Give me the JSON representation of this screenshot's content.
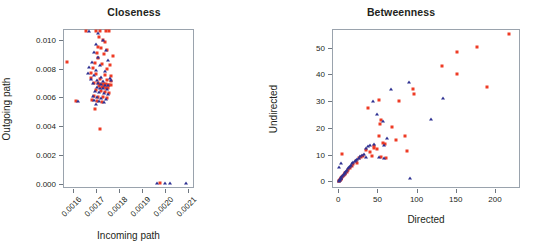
{
  "figure": {
    "background": "#ffffff",
    "series_colors": {
      "directed_red": "#ee3b24",
      "undirected_blue": "#2e3192"
    }
  },
  "panels": [
    {
      "id": "closeness",
      "title": "Closeness",
      "xlabel": "Incoming path",
      "ylabel": "Outgoing path",
      "xticks": [
        "0.0016",
        "0.0017",
        "0.0018",
        "0.0019",
        "0.0020",
        "0.0021"
      ],
      "yticks": [
        "0.000",
        "0.002",
        "0.004",
        "0.006",
        "0.008",
        "0.010"
      ]
    },
    {
      "id": "betweenness",
      "title": "Betweenness",
      "xlabel": "Directed",
      "ylabel": "Undirected",
      "xticks": [
        "0",
        "50",
        "100",
        "150",
        "200"
      ],
      "yticks": [
        "0",
        "10",
        "20",
        "30",
        "40",
        "50"
      ]
    }
  ],
  "chart_data": [
    {
      "type": "scatter",
      "title": "Closeness",
      "xlabel": "Incoming path",
      "ylabel": "Outgoing path",
      "xlim": [
        0.001555,
        0.002125
      ],
      "ylim": [
        -0.0003,
        0.01075
      ],
      "xticks": [
        0.0016,
        0.0017,
        0.0018,
        0.0019,
        0.002,
        0.0021
      ],
      "yticks": [
        0.0,
        0.002,
        0.004,
        0.006,
        0.008,
        0.01
      ],
      "grid": false,
      "legend": "none",
      "series": [
        {
          "name": "red-square",
          "marker": "square",
          "color": "#ee3b24",
          "points": [
            [
              0.001572,
              0.00849
            ],
            [
              0.00161,
              0.00578
            ],
            [
              0.001655,
              0.0106
            ],
            [
              0.0017,
              0.0106
            ],
            [
              0.001718,
              0.0106
            ],
            [
              0.001742,
              0.0106
            ],
            [
              0.001757,
              0.01059
            ],
            [
              0.001713,
              0.01018
            ],
            [
              0.00173,
              0.01
            ],
            [
              0.001739,
              0.00985
            ],
            [
              0.001707,
              0.00952
            ],
            [
              0.001722,
              0.00942
            ],
            [
              0.001748,
              0.0093
            ],
            [
              0.001702,
              0.00908
            ],
            [
              0.001735,
              0.009
            ],
            [
              0.001771,
              0.00888
            ],
            [
              0.001706,
              0.00872
            ],
            [
              0.001693,
              0.00838
            ],
            [
              0.001724,
              0.0083
            ],
            [
              0.001758,
              0.00822
            ],
            [
              0.001684,
              0.00805
            ],
            [
              0.001747,
              0.00798
            ],
            [
              0.001676,
              0.00772
            ],
            [
              0.0017,
              0.00765
            ],
            [
              0.001736,
              0.00757
            ],
            [
              0.001763,
              0.00748
            ],
            [
              0.001679,
              0.00733
            ],
            [
              0.001714,
              0.00726
            ],
            [
              0.001745,
              0.00718
            ],
            [
              0.001766,
              0.00712
            ],
            [
              0.00169,
              0.00702
            ],
            [
              0.001706,
              0.00698
            ],
            [
              0.001718,
              0.00696
            ],
            [
              0.001727,
              0.00694
            ],
            [
              0.001734,
              0.00692
            ],
            [
              0.001741,
              0.0069
            ],
            [
              0.001749,
              0.00688
            ],
            [
              0.001756,
              0.00686
            ],
            [
              0.001763,
              0.00684
            ],
            [
              0.001712,
              0.00678
            ],
            [
              0.001724,
              0.00674
            ],
            [
              0.001733,
              0.0067
            ],
            [
              0.001744,
              0.00666
            ],
            [
              0.001752,
              0.00662
            ],
            [
              0.0017,
              0.00648
            ],
            [
              0.001719,
              0.00642
            ],
            [
              0.001738,
              0.00636
            ],
            [
              0.001755,
              0.0063
            ],
            [
              0.00169,
              0.00612
            ],
            [
              0.001709,
              0.00605
            ],
            [
              0.001729,
              0.006
            ],
            [
              0.001747,
              0.00595
            ],
            [
              0.001683,
              0.0058
            ],
            [
              0.001704,
              0.00575
            ],
            [
              0.001726,
              0.00568
            ],
            [
              0.001696,
              0.0052
            ],
            [
              0.001716,
              0.00382
            ],
            [
              0.001975,
              4e-05
            ]
          ]
        },
        {
          "name": "blue-triangle",
          "marker": "triangle",
          "color": "#2e3192",
          "points": [
            [
              0.00162,
              0.00578
            ],
            [
              0.001668,
              0.0106
            ],
            [
              0.001709,
              0.01048
            ],
            [
              0.001727,
              0.00998
            ],
            [
              0.001697,
              0.00972
            ],
            [
              0.001742,
              0.00928
            ],
            [
              0.001688,
              0.00916
            ],
            [
              0.001706,
              0.0088
            ],
            [
              0.001752,
              0.00862
            ],
            [
              0.001681,
              0.00845
            ],
            [
              0.001716,
              0.00828
            ],
            [
              0.00167,
              0.00812
            ],
            [
              0.001698,
              0.0079
            ],
            [
              0.001736,
              0.00782
            ],
            [
              0.001665,
              0.00768
            ],
            [
              0.001688,
              0.00755
            ],
            [
              0.001722,
              0.00742
            ],
            [
              0.001759,
              0.00735
            ],
            [
              0.001676,
              0.00726
            ],
            [
              0.001701,
              0.00718
            ],
            [
              0.001731,
              0.00712
            ],
            [
              0.001763,
              0.00723
            ],
            [
              0.001686,
              0.00702
            ],
            [
              0.001708,
              0.00697
            ],
            [
              0.00172,
              0.00693
            ],
            [
              0.001737,
              0.00688
            ],
            [
              0.00175,
              0.00683
            ],
            [
              0.001702,
              0.00672
            ],
            [
              0.001715,
              0.00667
            ],
            [
              0.001729,
              0.00662
            ],
            [
              0.001745,
              0.00657
            ],
            [
              0.001694,
              0.00645
            ],
            [
              0.001712,
              0.00638
            ],
            [
              0.001734,
              0.00632
            ],
            [
              0.001752,
              0.00625
            ],
            [
              0.001684,
              0.00608
            ],
            [
              0.001702,
              0.00602
            ],
            [
              0.001722,
              0.00596
            ],
            [
              0.00174,
              0.0059
            ],
            [
              0.00169,
              0.00582
            ],
            [
              0.001711,
              0.00574
            ],
            [
              0.001733,
              0.00566
            ],
            [
              0.0017,
              0.00556
            ],
            [
              0.001962,
              4e-05
            ],
            [
              0.001998,
              4e-05
            ],
            [
              0.00202,
              4e-05
            ],
            [
              0.002092,
              4e-05
            ]
          ]
        }
      ]
    },
    {
      "type": "scatter",
      "title": "Betweenness",
      "xlabel": "Directed",
      "ylabel": "Unidirected",
      "xlim": [
        -8,
        232
      ],
      "ylim": [
        -2.5,
        57
      ],
      "xticks": [
        0,
        50,
        100,
        150,
        200
      ],
      "yticks": [
        0,
        10,
        20,
        30,
        40,
        50
      ],
      "grid": false,
      "legend": "none",
      "series": [
        {
          "name": "red-square",
          "marker": "square",
          "color": "#ee3b24",
          "points": [
            [
              218,
              55.0
            ],
            [
              177,
              50.4
            ],
            [
              151,
              48.5
            ],
            [
              133,
              43.2
            ],
            [
              152,
              40.2
            ],
            [
              190,
              35.4
            ],
            [
              95,
              34.5
            ],
            [
              97,
              32.7
            ],
            [
              78,
              30.2
            ],
            [
              52,
              30.6
            ],
            [
              38,
              27.4
            ],
            [
              54,
              23.1
            ],
            [
              53,
              21.4
            ],
            [
              68,
              20.4
            ],
            [
              85,
              17.1
            ],
            [
              52,
              16.8
            ],
            [
              74,
              15.4
            ],
            [
              57,
              14.2
            ],
            [
              60,
              13.9
            ],
            [
              46,
              13.3
            ],
            [
              88,
              11.5
            ],
            [
              45,
              12.3
            ],
            [
              49,
              12.0
            ],
            [
              36,
              11.8
            ],
            [
              40,
              10.8
            ],
            [
              5,
              10.1
            ],
            [
              32,
              9.6
            ],
            [
              43,
              9.4
            ],
            [
              55,
              9.1
            ],
            [
              61,
              8.6
            ],
            [
              29,
              9.0
            ],
            [
              26,
              8.6
            ],
            [
              22,
              7.6
            ],
            [
              24,
              6.9
            ],
            [
              19,
              6.5
            ],
            [
              17,
              5.6
            ],
            [
              15,
              4.9
            ],
            [
              13,
              4.2
            ],
            [
              11,
              3.6
            ],
            [
              9,
              3.0
            ],
            [
              8,
              2.6
            ],
            [
              7,
              2.2
            ],
            [
              6,
              1.9
            ],
            [
              5,
              1.6
            ],
            [
              4,
              1.3
            ],
            [
              3,
              1.0
            ],
            [
              3,
              0.8
            ],
            [
              2,
              0.6
            ],
            [
              2,
              0.4
            ],
            [
              1,
              0.3
            ],
            [
              1,
              0.2
            ]
          ]
        },
        {
          "name": "blue-triangle",
          "marker": "triangle",
          "color": "#2e3192",
          "points": [
            [
              134,
              31.0
            ],
            [
              118,
              23.3
            ],
            [
              90,
              37.2
            ],
            [
              67,
              34.4
            ],
            [
              62,
              16.3
            ],
            [
              57,
              22.7
            ],
            [
              50,
              25.3
            ],
            [
              44,
              30.0
            ],
            [
              92,
              1.4
            ],
            [
              41,
              13.6
            ],
            [
              38,
              13.2
            ],
            [
              46,
              13.9
            ],
            [
              35,
              12.6
            ],
            [
              59,
              13.5
            ],
            [
              33,
              10.4
            ],
            [
              30,
              9.8
            ],
            [
              28,
              9.4
            ],
            [
              26,
              8.8
            ],
            [
              24,
              8.4
            ],
            [
              22,
              8.0
            ],
            [
              21,
              7.6
            ],
            [
              19,
              7.1
            ],
            [
              18,
              6.8
            ],
            [
              16,
              6.2
            ],
            [
              15,
              5.8
            ],
            [
              14,
              5.4
            ],
            [
              12,
              4.8
            ],
            [
              11,
              4.4
            ],
            [
              10,
              4.0
            ],
            [
              9,
              3.6
            ],
            [
              8,
              3.2
            ],
            [
              7,
              2.9
            ],
            [
              6,
              2.5
            ],
            [
              5,
              2.1
            ],
            [
              4,
              1.7
            ],
            [
              4,
              1.4
            ],
            [
              3,
              1.1
            ],
            [
              2,
              0.9
            ],
            [
              2,
              0.6
            ],
            [
              1,
              0.4
            ],
            [
              1,
              0.25
            ],
            [
              1,
              5.2
            ],
            [
              3,
              7.0
            ],
            [
              36,
              9.2
            ],
            [
              52,
              9.0
            ],
            [
              58,
              8.8
            ]
          ]
        }
      ]
    }
  ]
}
